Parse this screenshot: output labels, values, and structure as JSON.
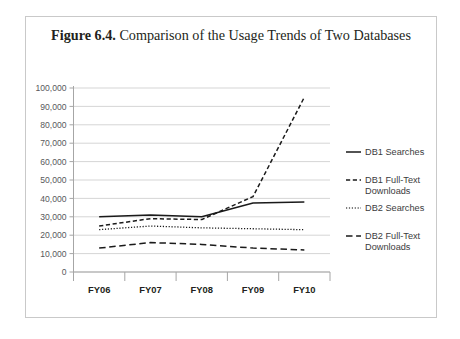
{
  "caption": {
    "label": "Figure 6.4.",
    "text": " Comparison of the Usage Trends of Two Databases"
  },
  "chart_data": {
    "type": "line",
    "title": "Figure 6.4. Comparison of the Usage Trends of Two Databases",
    "xlabel": "",
    "ylabel": "",
    "categories": [
      "FY06",
      "FY07",
      "FY08",
      "FY09",
      "FY10"
    ],
    "ylim": [
      0,
      100000
    ],
    "ytick_labels": [
      "100,000",
      "90,000",
      "80,000",
      "70,000",
      "60,000",
      "50,000",
      "40,000",
      "30,000",
      "20,000",
      "10,000",
      "0"
    ],
    "ytick_values": [
      100000,
      90000,
      80000,
      70000,
      60000,
      50000,
      40000,
      30000,
      20000,
      10000,
      0
    ],
    "grid": true,
    "grid_axis": "y",
    "legend_position": "right",
    "series": [
      {
        "name": "DB1 Searches",
        "style": "solid",
        "color": "#1a1a1a",
        "values": [
          30000,
          31000,
          30000,
          37500,
          38000
        ]
      },
      {
        "name": "DB1 Full-Text Downloads",
        "style": "short-dash",
        "color": "#1a1a1a",
        "values": [
          25000,
          29000,
          28500,
          41000,
          95000
        ]
      },
      {
        "name": "DB2 Searches",
        "style": "dotted",
        "color": "#555555",
        "values": [
          23000,
          25000,
          24000,
          23500,
          23000
        ]
      },
      {
        "name": "DB2 Full-Text Downloads",
        "style": "medium-dash",
        "color": "#1a1a1a",
        "values": [
          13000,
          16000,
          15000,
          13000,
          12000
        ]
      }
    ]
  },
  "legend": {
    "items": [
      {
        "label": "DB1 Searches",
        "line2": ""
      },
      {
        "label": "DB1 Full-Text",
        "line2": "Downloads"
      },
      {
        "label": "DB2 Searches",
        "line2": ""
      },
      {
        "label": "DB2 Full-Text",
        "line2": "Downloads"
      }
    ]
  },
  "axis": {
    "y_labels": [
      "100,000",
      "90,000",
      "80,000",
      "70,000",
      "60,000",
      "50,000",
      "40,000",
      "30,000",
      "20,000",
      "10,000",
      "0"
    ],
    "x_labels": [
      "FY06",
      "FY07",
      "FY08",
      "FY09",
      "FY10"
    ]
  },
  "colors": {
    "frame": "#c9c9c9",
    "grid": "#d0d0d0",
    "axis": "#a6a6a6",
    "ink": "#231f20",
    "series_dark": "#1a1a1a",
    "series_gray": "#555555",
    "background": "#ffffff"
  }
}
